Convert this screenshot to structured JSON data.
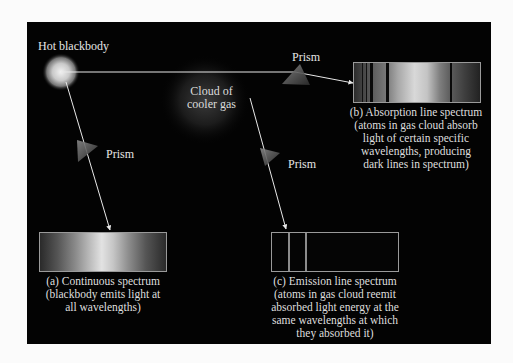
{
  "diagram": {
    "source": {
      "label": "Hot blackbody"
    },
    "cloud": {
      "label_lines": [
        "Cloud of",
        "cooler gas"
      ]
    },
    "prisms": [
      {
        "id": "prism-top",
        "label": "Prism"
      },
      {
        "id": "prism-left",
        "label": "Prism"
      },
      {
        "id": "prism-middle",
        "label": "Prism"
      }
    ],
    "spectra": {
      "continuous": {
        "caption_lines": [
          "(a) Continuous spectrum",
          "(blackbody emits light at",
          "all wavelengths)"
        ]
      },
      "absorption": {
        "caption_lines": [
          "(b) Absorption line spectrum",
          "(atoms in gas cloud absorb",
          "light of certain specific",
          "wavelengths, producing",
          "dark lines in spectrum)"
        ]
      },
      "emission": {
        "caption_lines": [
          "(c) Emission line spectrum",
          "(atoms in gas cloud reemit",
          "absorbed light energy at the",
          "same wavelengths at which",
          "they absorbed it)"
        ]
      }
    },
    "colors": {
      "background": "#030303",
      "page": "#fbfbfb",
      "ray": "#e8e8e8",
      "text": "#e6e6e6"
    }
  }
}
